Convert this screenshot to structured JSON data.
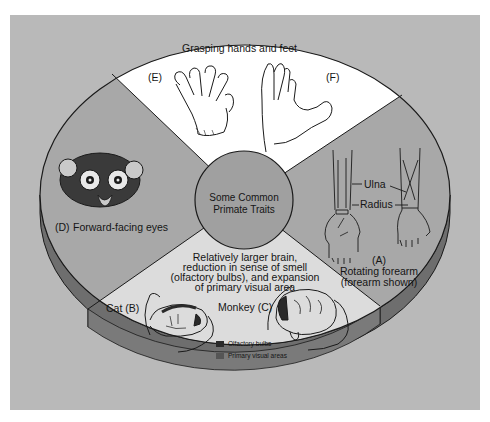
{
  "diagram": {
    "title": "Some Common Primate Traits",
    "center_label_lines": [
      "Some Common",
      "Primate Traits"
    ],
    "colors": {
      "background_box": "#b9b9b9",
      "page": "#ffffff",
      "wedge_top": "#ffffff",
      "wedge_left": "#a8a8a8",
      "wedge_right": "#a8a8a8",
      "wedge_bottom": "#dcdcdc",
      "center_circle": "#a0a0a0",
      "rim": "#6e6e6e",
      "outline": "#1a1a1a",
      "olfactory_swatch": "#2a2a2a",
      "visual_swatch": "#555555"
    },
    "sections": [
      {
        "id": "top",
        "heading": "Grasping hands and feet",
        "labels": [
          "(E)",
          "(F)"
        ]
      },
      {
        "id": "left",
        "letter": "(D)",
        "caption": "Forward-facing eyes"
      },
      {
        "id": "right",
        "letter": "(A)",
        "caption_lines": [
          "Rotating forearm",
          "(forearm shown)"
        ],
        "bone_labels": [
          "Ulna",
          "Radius"
        ]
      },
      {
        "id": "bottom",
        "caption_lines": [
          "Relatively larger brain,",
          "reduction in sense of smell",
          "(olfactory bulbs), and expansion",
          "of primary visual area"
        ],
        "animals": [
          "Cat (B)",
          "Monkey (C)"
        ],
        "legend": [
          {
            "label": "Olfactory bulbs",
            "swatch": "olfactory"
          },
          {
            "label": "Primary visual areas",
            "swatch": "visual"
          }
        ]
      }
    ]
  }
}
